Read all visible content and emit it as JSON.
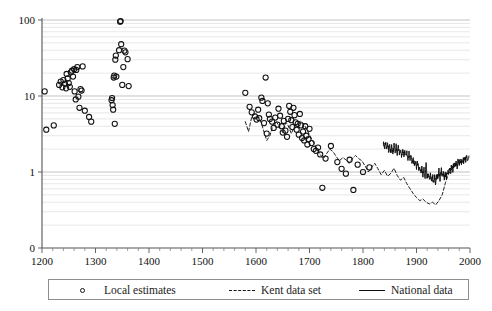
{
  "chart_data": {
    "type": "scatter",
    "title": "",
    "xlabel": "",
    "ylabel": "",
    "xlim": [
      1200,
      2000
    ],
    "ylim": [
      0.3,
      100
    ],
    "yscale": "log",
    "grid": true,
    "legend_position": "bottom",
    "xticks": [
      1200,
      1300,
      1400,
      1500,
      1600,
      1700,
      1800,
      1900,
      2000
    ],
    "xtick_labels": [
      "1200",
      "1300",
      "1400",
      "1500",
      "1600",
      "1700",
      "1800",
      "1900",
      "2000"
    ],
    "yticks": [
      1,
      10,
      100
    ],
    "ytick_labels": [
      "1",
      "10",
      "100"
    ],
    "yaxis_origin_label": "0",
    "series": [
      {
        "name": "Local estimates",
        "type": "scatter",
        "marker": "open-circle",
        "points": [
          [
            1205,
            11.5
          ],
          [
            1208,
            3.6
          ],
          [
            1222,
            4.1
          ],
          [
            1232,
            14.0
          ],
          [
            1235,
            15.5
          ],
          [
            1238,
            13.0
          ],
          [
            1240,
            16.2
          ],
          [
            1243,
            14.5
          ],
          [
            1245,
            12.6
          ],
          [
            1246,
            19.5
          ],
          [
            1248,
            17.0
          ],
          [
            1250,
            14.8
          ],
          [
            1252,
            13.2
          ],
          [
            1254,
            20.5
          ],
          [
            1256,
            21.5
          ],
          [
            1258,
            18.0
          ],
          [
            1260,
            22.5
          ],
          [
            1261,
            11.5
          ],
          [
            1263,
            9.0
          ],
          [
            1264,
            22.0
          ],
          [
            1266,
            24.0
          ],
          [
            1268,
            9.8
          ],
          [
            1270,
            7.0
          ],
          [
            1272,
            12.3
          ],
          [
            1274,
            11.8
          ],
          [
            1276,
            24.5
          ],
          [
            1280,
            6.4
          ],
          [
            1288,
            5.3
          ],
          [
            1292,
            4.6
          ],
          [
            1330,
            8.8
          ],
          [
            1331,
            9.4
          ],
          [
            1332,
            7.6
          ],
          [
            1333,
            6.6
          ],
          [
            1334,
            17.5
          ],
          [
            1335,
            18.5
          ],
          [
            1336,
            4.3
          ],
          [
            1337,
            30.0
          ],
          [
            1338,
            34.0
          ],
          [
            1339,
            18.0
          ],
          [
            1344,
            40.0
          ],
          [
            1346,
            95.0
          ],
          [
            1347,
            97.0
          ],
          [
            1348,
            48.0
          ],
          [
            1350,
            14.0
          ],
          [
            1352,
            24.0
          ],
          [
            1354,
            39.5
          ],
          [
            1356,
            37.5
          ],
          [
            1360,
            30.5
          ],
          [
            1362,
            13.5
          ],
          [
            1580,
            11.0
          ],
          [
            1588,
            7.2
          ],
          [
            1592,
            6.1
          ],
          [
            1598,
            5.4
          ],
          [
            1601,
            4.9
          ],
          [
            1604,
            6.6
          ],
          [
            1606,
            5.1
          ],
          [
            1610,
            9.5
          ],
          [
            1612,
            8.6
          ],
          [
            1615,
            4.4
          ],
          [
            1618,
            17.5
          ],
          [
            1620,
            3.2
          ],
          [
            1622,
            8.0
          ],
          [
            1624,
            5.7
          ],
          [
            1626,
            5.0
          ],
          [
            1630,
            4.6
          ],
          [
            1633,
            3.8
          ],
          [
            1636,
            5.2
          ],
          [
            1640,
            4.2
          ],
          [
            1642,
            6.8
          ],
          [
            1645,
            5.5
          ],
          [
            1648,
            4.0
          ],
          [
            1650,
            3.3
          ],
          [
            1652,
            4.7
          ],
          [
            1655,
            3.5
          ],
          [
            1658,
            2.9
          ],
          [
            1660,
            5.0
          ],
          [
            1662,
            7.4
          ],
          [
            1664,
            6.2
          ],
          [
            1666,
            4.8
          ],
          [
            1668,
            3.9
          ],
          [
            1670,
            7.0
          ],
          [
            1672,
            5.6
          ],
          [
            1674,
            4.5
          ],
          [
            1676,
            3.6
          ],
          [
            1678,
            4.3
          ],
          [
            1680,
            3.1
          ],
          [
            1682,
            5.8
          ],
          [
            1684,
            4.1
          ],
          [
            1686,
            2.8
          ],
          [
            1688,
            3.4
          ],
          [
            1690,
            2.6
          ],
          [
            1692,
            4.0
          ],
          [
            1694,
            3.0
          ],
          [
            1696,
            2.3
          ],
          [
            1698,
            2.7
          ],
          [
            1700,
            3.7
          ],
          [
            1704,
            2.4
          ],
          [
            1708,
            2.0
          ],
          [
            1712,
            1.9
          ],
          [
            1716,
            2.1
          ],
          [
            1720,
            1.7
          ],
          [
            1724,
            0.62
          ],
          [
            1730,
            1.5
          ],
          [
            1740,
            2.2
          ],
          [
            1752,
            1.35
          ],
          [
            1760,
            1.1
          ],
          [
            1768,
            0.95
          ],
          [
            1775,
            1.45
          ],
          [
            1782,
            0.58
          ],
          [
            1790,
            1.25
          ],
          [
            1800,
            1.0
          ],
          [
            1812,
            1.15
          ]
        ]
      },
      {
        "name": "Kent data set",
        "type": "line",
        "style": "dashed",
        "x_start": 1580,
        "x_end": 1990,
        "points": [
          [
            1580,
            4.6
          ],
          [
            1586,
            3.4
          ],
          [
            1592,
            5.3
          ],
          [
            1598,
            5.8
          ],
          [
            1604,
            5.4
          ],
          [
            1610,
            4.4
          ],
          [
            1616,
            3.2
          ],
          [
            1620,
            2.6
          ],
          [
            1626,
            3.0
          ],
          [
            1632,
            4.2
          ],
          [
            1638,
            4.6
          ],
          [
            1644,
            3.9
          ],
          [
            1650,
            3.3
          ],
          [
            1656,
            4.5
          ],
          [
            1660,
            4.1
          ],
          [
            1666,
            3.2
          ],
          [
            1672,
            4.0
          ],
          [
            1678,
            4.4
          ],
          [
            1684,
            4.7
          ],
          [
            1690,
            4.2
          ],
          [
            1696,
            3.5
          ],
          [
            1702,
            2.9
          ],
          [
            1708,
            2.4
          ],
          [
            1714,
            2.0
          ],
          [
            1720,
            1.7
          ],
          [
            1726,
            1.5
          ],
          [
            1732,
            1.75
          ],
          [
            1738,
            2.0
          ],
          [
            1744,
            1.85
          ],
          [
            1750,
            1.6
          ],
          [
            1756,
            1.4
          ],
          [
            1762,
            1.55
          ],
          [
            1768,
            1.45
          ],
          [
            1774,
            1.3
          ],
          [
            1780,
            1.5
          ],
          [
            1786,
            1.65
          ],
          [
            1792,
            1.5
          ],
          [
            1798,
            1.4
          ],
          [
            1804,
            1.2
          ],
          [
            1810,
            1.0
          ],
          [
            1816,
            1.15
          ],
          [
            1822,
            1.3
          ],
          [
            1828,
            1.1
          ],
          [
            1834,
            0.92
          ],
          [
            1840,
            1.05
          ],
          [
            1846,
            0.88
          ],
          [
            1852,
            0.96
          ],
          [
            1858,
            1.12
          ],
          [
            1864,
            0.9
          ],
          [
            1870,
            0.78
          ],
          [
            1876,
            0.85
          ],
          [
            1882,
            0.7
          ],
          [
            1888,
            0.6
          ],
          [
            1894,
            0.52
          ],
          [
            1900,
            0.46
          ],
          [
            1906,
            0.42
          ],
          [
            1912,
            0.44
          ],
          [
            1918,
            0.4
          ],
          [
            1924,
            0.38
          ],
          [
            1930,
            0.4
          ],
          [
            1936,
            0.37
          ],
          [
            1942,
            0.42
          ],
          [
            1948,
            0.5
          ],
          [
            1954,
            0.72
          ],
          [
            1960,
            0.95
          ],
          [
            1966,
            1.1
          ],
          [
            1972,
            1.2
          ],
          [
            1978,
            1.3
          ],
          [
            1984,
            1.4
          ],
          [
            1990,
            1.45
          ]
        ]
      },
      {
        "name": "National data",
        "type": "line",
        "style": "solid",
        "x_start": 1838,
        "x_end": 1998,
        "points": [
          [
            1838,
            2.55
          ],
          [
            1840,
            2.05
          ],
          [
            1842,
            2.5
          ],
          [
            1844,
            1.95
          ],
          [
            1846,
            2.45
          ],
          [
            1848,
            1.9
          ],
          [
            1850,
            2.35
          ],
          [
            1852,
            1.85
          ],
          [
            1854,
            2.3
          ],
          [
            1856,
            1.82
          ],
          [
            1858,
            2.2
          ],
          [
            1860,
            1.78
          ],
          [
            1862,
            2.15
          ],
          [
            1864,
            1.74
          ],
          [
            1866,
            2.1
          ],
          [
            1868,
            1.72
          ],
          [
            1870,
            2.0
          ],
          [
            1872,
            1.7
          ],
          [
            1874,
            1.95
          ],
          [
            1876,
            1.66
          ],
          [
            1878,
            1.9
          ],
          [
            1880,
            1.62
          ],
          [
            1882,
            1.8
          ],
          [
            1884,
            1.5
          ],
          [
            1886,
            1.72
          ],
          [
            1888,
            1.42
          ],
          [
            1890,
            1.62
          ],
          [
            1892,
            1.35
          ],
          [
            1894,
            1.5
          ],
          [
            1896,
            1.25
          ],
          [
            1898,
            1.4
          ],
          [
            1900,
            1.18
          ],
          [
            1902,
            1.3
          ],
          [
            1904,
            1.1
          ],
          [
            1906,
            1.22
          ],
          [
            1908,
            1.0
          ],
          [
            1910,
            1.15
          ],
          [
            1912,
            0.94
          ],
          [
            1914,
            1.1
          ],
          [
            1916,
            0.88
          ],
          [
            1918,
            1.22
          ],
          [
            1920,
            0.82
          ],
          [
            1922,
            1.0
          ],
          [
            1924,
            0.8
          ],
          [
            1926,
            0.95
          ],
          [
            1928,
            0.76
          ],
          [
            1930,
            0.9
          ],
          [
            1932,
            0.72
          ],
          [
            1934,
            0.86
          ],
          [
            1936,
            0.7
          ],
          [
            1938,
            0.95
          ],
          [
            1940,
            0.78
          ],
          [
            1942,
            1.05
          ],
          [
            1944,
            0.8
          ],
          [
            1946,
            1.12
          ],
          [
            1948,
            0.84
          ],
          [
            1950,
            1.0
          ],
          [
            1952,
            0.82
          ],
          [
            1954,
            0.95
          ],
          [
            1956,
            0.86
          ],
          [
            1958,
            1.05
          ],
          [
            1960,
            0.92
          ],
          [
            1962,
            1.15
          ],
          [
            1964,
            1.0
          ],
          [
            1966,
            1.25
          ],
          [
            1968,
            1.08
          ],
          [
            1970,
            1.3
          ],
          [
            1972,
            1.15
          ],
          [
            1974,
            1.32
          ],
          [
            1976,
            1.2
          ],
          [
            1978,
            1.4
          ],
          [
            1980,
            1.28
          ],
          [
            1982,
            1.45
          ],
          [
            1984,
            1.35
          ],
          [
            1986,
            1.5
          ],
          [
            1988,
            1.4
          ],
          [
            1990,
            1.55
          ],
          [
            1992,
            1.45
          ],
          [
            1994,
            1.6
          ],
          [
            1996,
            1.5
          ],
          [
            1998,
            1.62
          ]
        ]
      }
    ]
  },
  "legend": {
    "items": [
      {
        "label": "Local estimates",
        "glyph": "open-circle-marker"
      },
      {
        "label": "Kent data set",
        "glyph": "dashed-line"
      },
      {
        "label": "National data",
        "glyph": "solid-line"
      }
    ]
  }
}
